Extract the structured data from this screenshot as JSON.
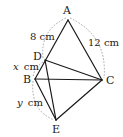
{
  "diagram": {
    "type": "geometry",
    "points": {
      "A": {
        "label": "A",
        "x": 68,
        "y": 20
      },
      "D": {
        "label": "D",
        "x": 45,
        "y": 60
      },
      "B": {
        "label": "B",
        "x": 35,
        "y": 79
      },
      "C": {
        "label": "C",
        "x": 102,
        "y": 80
      },
      "E": {
        "label": "E",
        "x": 56,
        "y": 120
      }
    },
    "segments": [
      "AB",
      "AC",
      "DC",
      "BC",
      "BE",
      "CE",
      "DE"
    ],
    "measurements": {
      "AD": {
        "value": "8",
        "unit": "cm"
      },
      "AC": {
        "value": "12",
        "unit": "cm"
      },
      "DB": {
        "var": "x",
        "unit": "cm"
      },
      "BE": {
        "var": "y",
        "unit": "cm"
      }
    },
    "labels": {
      "A": "A",
      "B": "B",
      "C": "C",
      "D": "D",
      "E": "E",
      "ad_value": "8 cm",
      "ac_value": "12 cm",
      "x_var": "x",
      "y_var": "y",
      "unit": "cm"
    },
    "colors": {
      "line": "#1a1a1a",
      "dimension_arc": "#9a9a9a",
      "background": "#ffffff"
    }
  }
}
